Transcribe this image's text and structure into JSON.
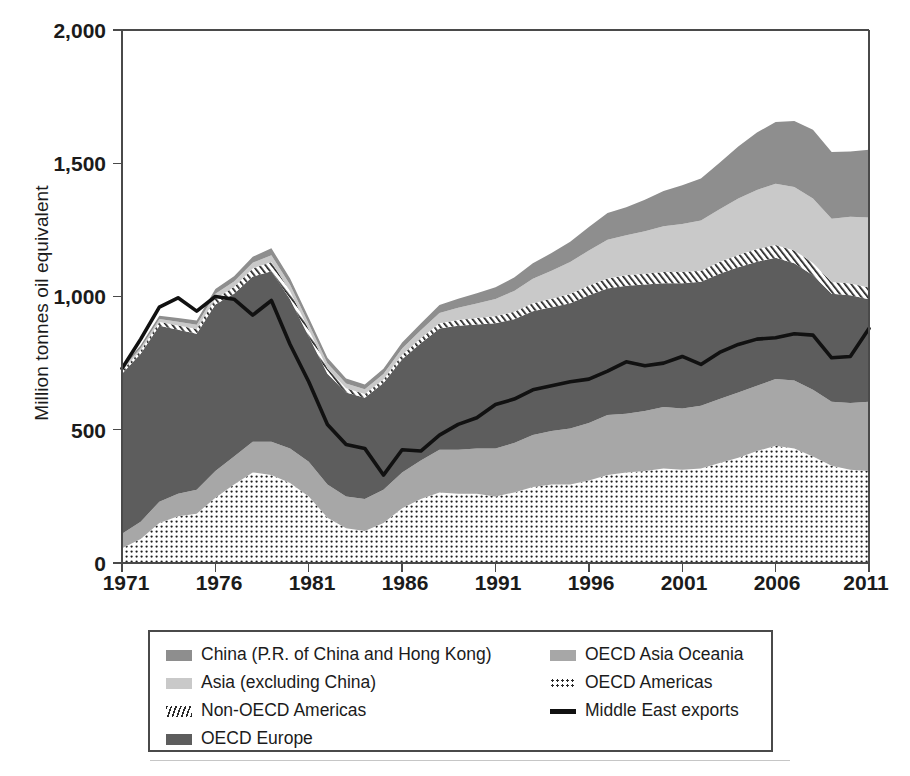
{
  "axes": {
    "ylabel": "Million tonnes oil equivalent",
    "yticks": [
      "2,000",
      "1,500",
      "1,000",
      "500",
      "0"
    ],
    "xticks": [
      "1971",
      "1976",
      "1981",
      "1986",
      "1991",
      "1996",
      "2001",
      "2006",
      "2011"
    ]
  },
  "legend": {
    "left": [
      {
        "label": "China (P.R. of China and Hong Kong)",
        "swatch": "china-swatch"
      },
      {
        "label": "Asia (excluding China)",
        "swatch": "asia-swatch"
      },
      {
        "label": "Non-OECD Americas",
        "swatch": "non-oecd-americas-swatch"
      },
      {
        "label": "OECD Europe",
        "swatch": "oecd-europe-swatch"
      }
    ],
    "right": [
      {
        "label": "OECD Asia Oceania",
        "swatch": "oecd-asia-oceania-swatch"
      },
      {
        "label": "OECD Americas",
        "swatch": "oecd-americas-swatch"
      },
      {
        "label": "Middle East exports",
        "swatch": "middle-east-line-swatch"
      }
    ]
  },
  "colors": {
    "china": "#8e8e8e",
    "asia": "#c9c9c9",
    "non_oecd_americas": "#ffffff",
    "oecd_europe": "#5d5d5d",
    "oecd_asia_oceania": "#a7a7a7",
    "oecd_americas": "#ffffff",
    "middle_east_line": "#111111",
    "frame": "#4a4a4a"
  },
  "chart_data": {
    "type": "area",
    "stacked": true,
    "title": "",
    "xlabel": "",
    "ylabel": "Million tonnes oil equivalent",
    "xlim": [
      1971,
      2011
    ],
    "ylim": [
      0,
      2000
    ],
    "grid": false,
    "legend_position": "bottom",
    "x": [
      1971,
      1972,
      1973,
      1974,
      1975,
      1976,
      1977,
      1978,
      1979,
      1980,
      1981,
      1982,
      1983,
      1984,
      1985,
      1986,
      1987,
      1988,
      1989,
      1990,
      1991,
      1992,
      1993,
      1994,
      1995,
      1996,
      1997,
      1998,
      1999,
      2000,
      2001,
      2002,
      2003,
      2004,
      2005,
      2006,
      2007,
      2008,
      2009,
      2010,
      2011
    ],
    "stack_order_bottom_to_top": [
      "OECD Americas",
      "OECD Asia Oceania",
      "OECD Europe",
      "Non-OECD Americas",
      "Asia (excluding China)",
      "China (P.R. of China and Hong Kong)"
    ],
    "series": [
      {
        "name": "OECD Americas",
        "fill": "dots",
        "values": [
          55,
          90,
          150,
          175,
          185,
          245,
          295,
          340,
          330,
          300,
          250,
          170,
          130,
          120,
          150,
          205,
          240,
          265,
          260,
          260,
          250,
          265,
          285,
          295,
          295,
          310,
          330,
          340,
          345,
          355,
          350,
          355,
          375,
          395,
          420,
          440,
          430,
          400,
          365,
          350,
          345
        ]
      },
      {
        "name": "OECD Asia Oceania",
        "fill": "#a7a7a7",
        "values": [
          55,
          65,
          80,
          85,
          90,
          100,
          105,
          115,
          125,
          130,
          130,
          125,
          120,
          120,
          125,
          135,
          145,
          160,
          165,
          170,
          180,
          185,
          195,
          200,
          210,
          215,
          225,
          220,
          225,
          230,
          230,
          235,
          240,
          245,
          245,
          250,
          255,
          250,
          240,
          250,
          260
        ]
      },
      {
        "name": "OECD Europe",
        "fill": "#5d5d5d",
        "values": [
          600,
          630,
          660,
          615,
          585,
          625,
          610,
          620,
          640,
          560,
          470,
          415,
          390,
          380,
          400,
          425,
          440,
          455,
          465,
          465,
          470,
          465,
          465,
          465,
          470,
          480,
          475,
          480,
          475,
          465,
          470,
          465,
          470,
          470,
          465,
          455,
          440,
          430,
          405,
          405,
          385
        ]
      },
      {
        "name": "Non-OECD Americas",
        "fill": "hatch",
        "values": [
          10,
          12,
          14,
          16,
          18,
          22,
          26,
          30,
          34,
          30,
          26,
          20,
          16,
          14,
          14,
          16,
          18,
          20,
          22,
          24,
          26,
          28,
          30,
          32,
          34,
          36,
          38,
          40,
          40,
          42,
          42,
          42,
          44,
          46,
          48,
          48,
          48,
          46,
          44,
          44,
          44
        ]
      },
      {
        "name": "Asia (excluding China)",
        "fill": "#c9c9c9",
        "values": [
          8,
          10,
          12,
          14,
          16,
          18,
          20,
          22,
          26,
          24,
          22,
          20,
          18,
          18,
          20,
          24,
          30,
          38,
          46,
          55,
          65,
          78,
          92,
          105,
          120,
          132,
          145,
          150,
          160,
          172,
          180,
          188,
          198,
          212,
          222,
          230,
          238,
          242,
          238,
          250,
          262
        ]
      },
      {
        "name": "China (P.R. of China and Hong Kong)",
        "fill": "#8e8e8e",
        "values": [
          8,
          10,
          12,
          14,
          16,
          18,
          20,
          22,
          26,
          24,
          22,
          20,
          18,
          18,
          20,
          22,
          26,
          30,
          34,
          38,
          44,
          50,
          58,
          66,
          76,
          88,
          100,
          105,
          118,
          132,
          145,
          158,
          175,
          195,
          215,
          232,
          248,
          258,
          250,
          245,
          255
        ]
      }
    ],
    "line_series": {
      "name": "Middle East exports",
      "color": "#111111",
      "values": [
        730,
        840,
        960,
        995,
        945,
        1000,
        990,
        930,
        985,
        820,
        680,
        520,
        445,
        430,
        330,
        425,
        420,
        480,
        520,
        545,
        595,
        615,
        650,
        665,
        680,
        690,
        720,
        755,
        740,
        750,
        775,
        745,
        790,
        820,
        840,
        845,
        860,
        855,
        770,
        775,
        880
      ]
    }
  }
}
